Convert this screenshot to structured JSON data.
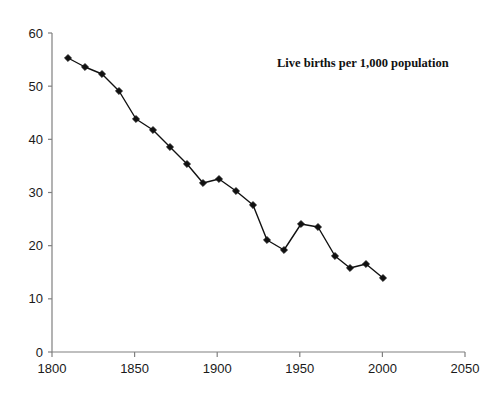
{
  "chart_data": {
    "type": "line",
    "title": "",
    "annotation": "Live births per 1,000 population",
    "xlabel": "",
    "ylabel": "",
    "xlim": [
      1800,
      2050
    ],
    "ylim": [
      0,
      60
    ],
    "grid": false,
    "legend": "none",
    "xticks": [
      1800,
      1850,
      1900,
      1950,
      2000,
      2050
    ],
    "xtick_labels": [
      "1800",
      "1850",
      "1900",
      "1950",
      "2000",
      "2050"
    ],
    "yticks": [
      0,
      10,
      20,
      30,
      40,
      50,
      60
    ],
    "ytick_labels": [
      "0",
      "10",
      "20",
      "30",
      "40",
      "50",
      "60"
    ],
    "marker": "diamond",
    "line_color": "#111111",
    "marker_color": "#111111",
    "axis_color": "#808080",
    "background": "#ffffff",
    "x": [
      1810,
      1820,
      1827,
      1838,
      1848,
      1857,
      1866,
      1874,
      1882,
      1888,
      1895,
      1902,
      1910,
      1917,
      1922,
      1930,
      1937,
      1945,
      1952,
      1961,
      1972,
      1980,
      1990,
      2001
    ],
    "values": [
      54.4,
      53.0,
      51.5,
      48.5,
      43.5,
      41.5,
      38.5,
      35.3,
      32.0,
      32.5,
      30.5,
      28.0,
      21.2,
      19.5,
      24.0,
      23.7,
      18.3,
      16.0,
      16.8,
      14.3,
      21.2,
      19.5,
      16.0,
      14.3
    ],
    "series": [
      {
        "name": "Live births per 1,000 population",
        "points": [
          {
            "x": 1810,
            "y": 54.4
          },
          {
            "x": 1820,
            "y": 53.0
          },
          {
            "x": 1827,
            "y": 51.5
          },
          {
            "x": 1838,
            "y": 48.5
          },
          {
            "x": 1848,
            "y": 43.5
          },
          {
            "x": 1857,
            "y": 41.5
          },
          {
            "x": 1866,
            "y": 38.5
          },
          {
            "x": 1874,
            "y": 35.3
          },
          {
            "x": 1882,
            "y": 32.0
          },
          {
            "x": 1888,
            "y": 32.6
          },
          {
            "x": 1895,
            "y": 30.6
          },
          {
            "x": 1902,
            "y": 28.1
          },
          {
            "x": 1911,
            "y": 21.3
          },
          {
            "x": 1919,
            "y": 19.6
          },
          {
            "x": 1928,
            "y": 24.1
          },
          {
            "x": 1938,
            "y": 23.7
          },
          {
            "x": 1946,
            "y": 18.3
          },
          {
            "x": 1955,
            "y": 16.0
          },
          {
            "x": 1963,
            "y": 16.9
          },
          {
            "x": 1972,
            "y": 14.3
          }
        ]
      }
    ]
  },
  "plot": {
    "points": [
      {
        "px": 68,
        "py": 58
      },
      {
        "px": 85,
        "py": 67
      },
      {
        "px": 102,
        "py": 74
      },
      {
        "px": 119,
        "py": 91
      },
      {
        "px": 136,
        "py": 119
      },
      {
        "px": 153,
        "py": 130
      },
      {
        "px": 170,
        "py": 147
      },
      {
        "px": 187,
        "py": 164
      },
      {
        "px": 203,
        "py": 183
      },
      {
        "px": 219,
        "py": 179
      },
      {
        "px": 236,
        "py": 191
      },
      {
        "px": 253,
        "py": 205
      },
      {
        "px": 267,
        "py": 240
      },
      {
        "px": 284,
        "py": 250
      },
      {
        "px": 301,
        "py": 224
      },
      {
        "px": 318,
        "py": 227
      },
      {
        "px": 335,
        "py": 256
      },
      {
        "px": 350,
        "py": 268
      },
      {
        "px": 366,
        "py": 264
      },
      {
        "px": 383,
        "py": 278
      }
    ]
  },
  "annotation": {
    "text": "Live births per 1,000 population"
  }
}
